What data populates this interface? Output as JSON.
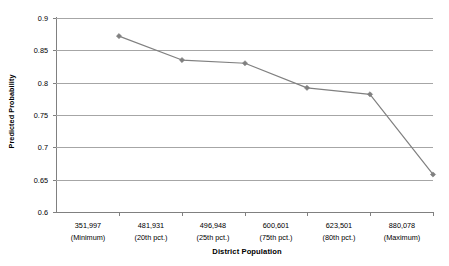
{
  "chart_data": {
    "type": "line",
    "title": "",
    "xlabel": "District Population",
    "ylabel": "Predicted Probability",
    "ylim": [
      0.6,
      0.9
    ],
    "ytick_labels": [
      "0.9",
      "0.85",
      "0.8",
      "0.75",
      "0.7",
      "0.65",
      "0.6"
    ],
    "ytick_values": [
      0.9,
      0.85,
      0.8,
      0.75,
      0.7,
      0.65,
      0.6
    ],
    "grid": "horizontal",
    "legend": "none",
    "categories": [
      "351,997\n(Minimum)",
      "481,931\n(20th pct.)",
      "496,948\n(25th pct.)",
      "600,601\n(75th pct.)",
      "623,501\n(80th pct.)",
      "880,078\n(Maximum)"
    ],
    "category_values": [
      "351,997",
      "481,931",
      "496,948",
      "600,601",
      "623,501",
      "880,078"
    ],
    "category_notes": [
      "(Minimum)",
      "(20th pct.)",
      "(25th pct.)",
      "(75th pct.)",
      "(80th pct.)",
      "(Maximum)"
    ],
    "values": [
      0.872,
      0.835,
      0.83,
      0.792,
      0.782,
      0.658
    ],
    "series": [
      {
        "name": "Predicted Probability",
        "values": [
          0.872,
          0.835,
          0.83,
          0.792,
          0.782,
          0.658
        ],
        "color": "#808080",
        "marker": "diamond"
      }
    ],
    "colors": {
      "line": "#808080",
      "marker": "#808080",
      "gridline": "#a6a6a6",
      "axis": "#808080",
      "text": "#000000",
      "background": "#ffffff"
    }
  }
}
